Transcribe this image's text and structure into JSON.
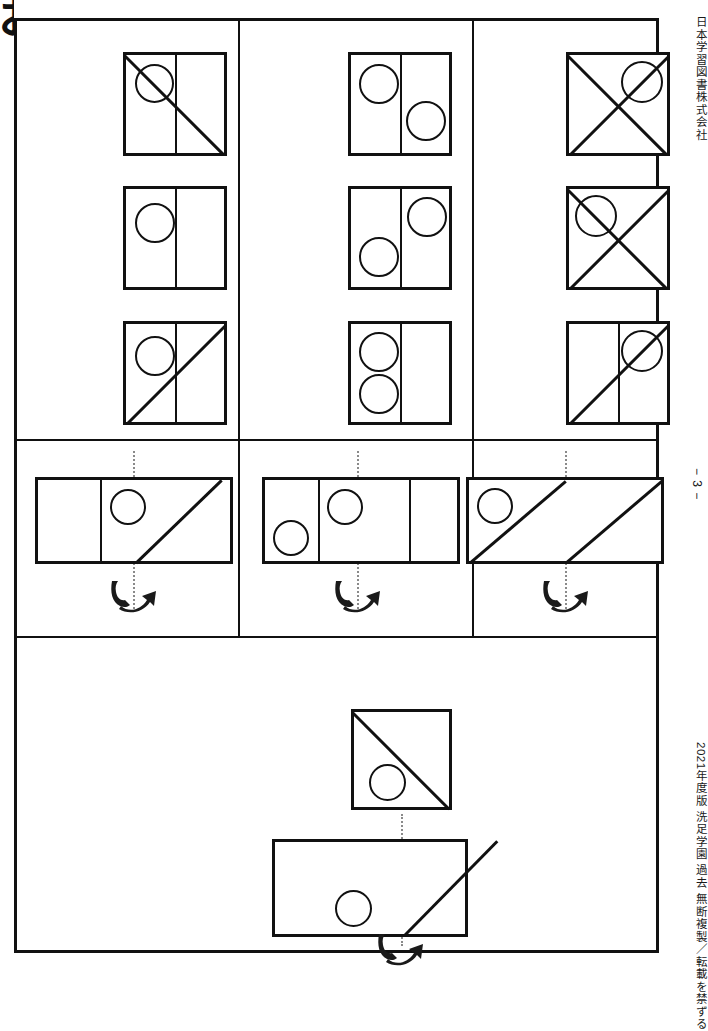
{
  "page": {
    "width": 708,
    "height": 968,
    "background": "#ffffff",
    "ink": "#111111",
    "fold_line_color": "#8a8a8a",
    "corner_mark": "お"
  },
  "sidebar": {
    "publisher": "日本学習図書株式会社",
    "page_number": "− 3 −",
    "copyright": "2021年度版 洗足学園 過去 無断複製／転載を禁ずる"
  },
  "worksheet": {
    "title": "折り重ね図形 プリント",
    "sections": [
      {
        "id": "answer-choices",
        "name": "answer-choice-grid",
        "columns": [
          {
            "id": "col-1",
            "cells": [
              {
                "id": "c1r1",
                "shape": "square",
                "dividers": [
                  "vertical-center"
                ],
                "diagonals": [
                  "top-left-to-bottom-right"
                ],
                "circles": [
                  {
                    "quadrant": "upper-left"
                  }
                ]
              },
              {
                "id": "c1r2",
                "shape": "square",
                "dividers": [
                  "vertical-center"
                ],
                "diagonals": [],
                "circles": [
                  {
                    "quadrant": "upper-left"
                  }
                ]
              },
              {
                "id": "c1r3",
                "shape": "square",
                "dividers": [
                  "vertical-center"
                ],
                "diagonals": [
                  "bottom-left-to-top-right"
                ],
                "circles": [
                  {
                    "quadrant": "upper-left"
                  }
                ]
              }
            ]
          },
          {
            "id": "col-2",
            "cells": [
              {
                "id": "c2r1",
                "shape": "square",
                "dividers": [
                  "vertical-center"
                ],
                "diagonals": [],
                "circles": [
                  {
                    "quadrant": "upper-left"
                  },
                  {
                    "quadrant": "lower-right"
                  }
                ]
              },
              {
                "id": "c2r2",
                "shape": "square",
                "dividers": [
                  "vertical-center"
                ],
                "diagonals": [],
                "circles": [
                  {
                    "quadrant": "upper-right"
                  },
                  {
                    "quadrant": "lower-left"
                  }
                ]
              },
              {
                "id": "c2r3",
                "shape": "square",
                "dividers": [
                  "vertical-center"
                ],
                "diagonals": [],
                "circles": [
                  {
                    "quadrant": "upper-left"
                  },
                  {
                    "quadrant": "lower-left"
                  }
                ]
              }
            ]
          },
          {
            "id": "col-3",
            "cells": [
              {
                "id": "c3r1",
                "shape": "square",
                "dividers": [],
                "diagonals": [
                  "top-left-to-bottom-right",
                  "bottom-left-to-top-right"
                ],
                "circles": [
                  {
                    "quadrant": "upper-right"
                  }
                ]
              },
              {
                "id": "c3r2",
                "shape": "square",
                "dividers": [],
                "diagonals": [
                  "top-left-to-bottom-right",
                  "bottom-left-to-top-right"
                ],
                "circles": [
                  {
                    "quadrant": "upper-left"
                  }
                ]
              },
              {
                "id": "c3r3",
                "shape": "square",
                "dividers": [
                  "vertical-center"
                ],
                "diagonals": [
                  "bottom-left-to-top-right"
                ],
                "circles": [
                  {
                    "quadrant": "upper-right"
                  }
                ]
              }
            ]
          }
        ]
      },
      {
        "id": "questions",
        "name": "question-row",
        "cells": [
          {
            "id": "q1",
            "shape": "wide-rectangle",
            "panels": 3,
            "dividers": [
              "at-1/3",
              "fold-center"
            ],
            "diagonals": [
              "bottom-center-to-top-right"
            ],
            "circles": [
              {
                "position": "panel-2-upper"
              }
            ],
            "fold_line": true,
            "fold_arrow": "fold-right-over-left"
          },
          {
            "id": "q2",
            "shape": "wide-rectangle",
            "panels": 3,
            "dividers": [
              "at-1/4",
              "at-3/4"
            ],
            "diagonals": [],
            "circles": [
              {
                "position": "panel-1-lower"
              },
              {
                "position": "panel-2-upper"
              }
            ],
            "fold_line": true,
            "fold_arrow": "fold-right-over-left"
          },
          {
            "id": "q3",
            "shape": "wide-rectangle",
            "panels": 2,
            "dividers": [],
            "diagonals": [
              "left-half-bottom-left-to-top-right",
              "right-half-bottom-left-to-top-right"
            ],
            "circles": [
              {
                "position": "panel-1-upper-left"
              }
            ],
            "fold_line": true,
            "fold_arrow": "fold-right-over-left"
          }
        ]
      },
      {
        "id": "example",
        "name": "worked-example",
        "result": {
          "id": "ex-result",
          "shape": "square",
          "dividers": [],
          "diagonals": [
            "top-left-to-bottom-right"
          ],
          "circles": [
            {
              "quadrant": "lower-left"
            }
          ]
        },
        "source": {
          "id": "ex-source",
          "shape": "wide-rectangle",
          "panels": 2,
          "dividers": [],
          "diagonals": [
            "right-half-bottom-left-to-top-right"
          ],
          "circles": [
            {
              "position": "panel-1-lower-right"
            }
          ],
          "fold_line": true,
          "fold_arrow": "fold-right-over-left"
        }
      }
    ]
  }
}
